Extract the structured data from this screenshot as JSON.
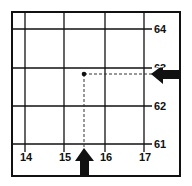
{
  "diagram": {
    "type": "grid-reference",
    "eastings": [
      "14",
      "15",
      "16",
      "17"
    ],
    "northings": [
      "64",
      "63",
      "62",
      "61"
    ],
    "point": {
      "easting": 15.5,
      "northing": 63.8
    },
    "arrows": {
      "up": "easting-indicator",
      "left": "northing-indicator"
    }
  }
}
